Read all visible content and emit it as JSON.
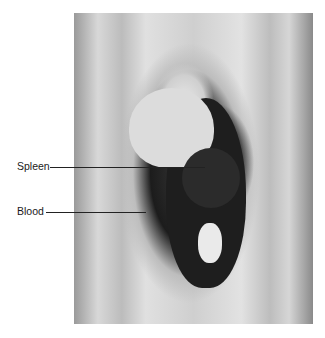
{
  "image": {
    "description": "Black-and-white autopsy photograph of an opened abdomen with labeled anatomy",
    "labels": [
      {
        "text": "Spleen"
      },
      {
        "text": "Blood"
      }
    ]
  }
}
